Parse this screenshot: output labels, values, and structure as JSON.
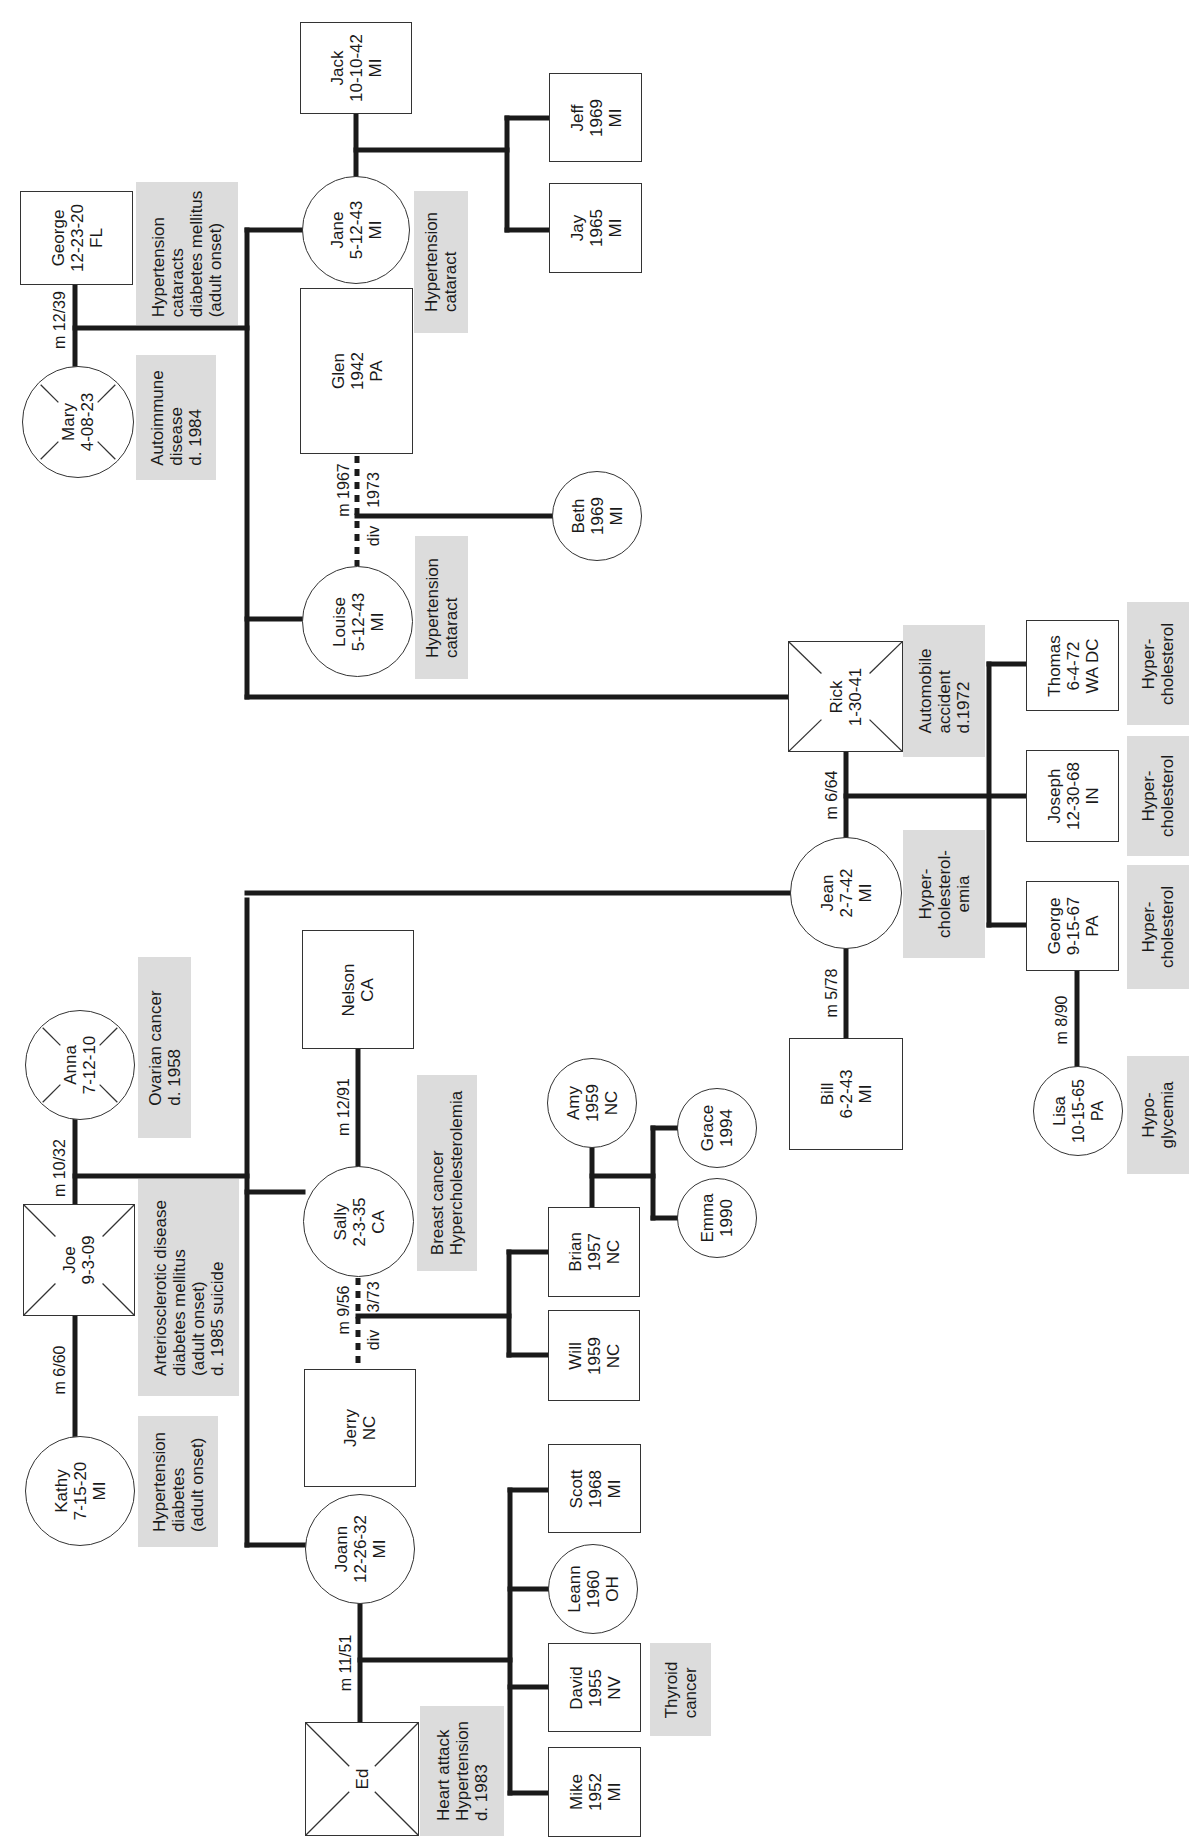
{
  "orientation": "rotated -90deg (text reads bottom-to-top)",
  "people": {
    "george_sr": {
      "name": "George",
      "born": "12-23-20",
      "place": "FL",
      "sex": "male",
      "deceased": false
    },
    "mary": {
      "name": "Mary",
      "born": "4-08-23",
      "sex": "female",
      "deceased": true
    },
    "jane": {
      "name": "Jane",
      "born": "5-12-43",
      "place": "MI",
      "sex": "female"
    },
    "jack": {
      "name": "Jack",
      "born": "10-10-42",
      "place": "MI",
      "sex": "male"
    },
    "jeff": {
      "name": "Jeff",
      "born": "1969",
      "place": "MI",
      "sex": "male"
    },
    "jay": {
      "name": "Jay",
      "born": "1965",
      "place": "MI",
      "sex": "male"
    },
    "glen": {
      "name": "Glen",
      "born": "1942",
      "place": "PA",
      "sex": "male"
    },
    "louise": {
      "name": "Louise",
      "born": "5-12-43",
      "place": "MI",
      "sex": "female"
    },
    "beth": {
      "name": "Beth",
      "born": "1969",
      "place": "MI",
      "sex": "female"
    },
    "rick": {
      "name": "Rick",
      "born": "1-30-41",
      "sex": "male",
      "deceased": true
    },
    "jean": {
      "name": "Jean",
      "born": "2-7-42",
      "place": "MI",
      "sex": "female"
    },
    "bill": {
      "name": "Bill",
      "born": "6-2-43",
      "place": "MI",
      "sex": "male"
    },
    "thomas": {
      "name": "Thomas",
      "born": "6-4-72",
      "place": "WA DC",
      "sex": "male"
    },
    "joseph": {
      "name": "Joseph",
      "born": "12-30-68",
      "place": "IN",
      "sex": "male"
    },
    "george_jr": {
      "name": "George",
      "born": "9-15-67",
      "place": "PA",
      "sex": "male"
    },
    "lisa": {
      "name": "Lisa",
      "born": "10-15-65",
      "place": "PA",
      "sex": "female"
    },
    "anna": {
      "name": "Anna",
      "born": "7-12-10",
      "sex": "female",
      "deceased": true
    },
    "joe": {
      "name": "Joe",
      "born": "9-3-09",
      "sex": "male",
      "deceased": true
    },
    "kathy": {
      "name": "Kathy",
      "born": "7-15-20",
      "place": "MI",
      "sex": "female"
    },
    "nelson": {
      "name": "Nelson",
      "place": "CA",
      "sex": "male"
    },
    "sally": {
      "name": "Sally",
      "born": "2-3-35",
      "place": "CA",
      "sex": "female"
    },
    "jerry": {
      "name": "Jerry",
      "place": "NC",
      "sex": "male"
    },
    "brian": {
      "name": "Brian",
      "born": "1957",
      "place": "NC",
      "sex": "male"
    },
    "will": {
      "name": "Will",
      "born": "1959",
      "place": "NC",
      "sex": "male"
    },
    "amy": {
      "name": "Amy",
      "born": "1959",
      "place": "NC",
      "sex": "female"
    },
    "grace": {
      "name": "Grace",
      "born": "1994",
      "sex": "female"
    },
    "emma": {
      "name": "Emma",
      "born": "1990",
      "sex": "female"
    },
    "joann": {
      "name": "Joann",
      "born": "12-26-32",
      "place": "MI",
      "sex": "female"
    },
    "ed": {
      "name": "Ed",
      "sex": "male",
      "deceased": true
    },
    "scott": {
      "name": "Scott",
      "born": "1968",
      "place": "MI",
      "sex": "male"
    },
    "leann": {
      "name": "Leann",
      "born": "1960",
      "place": "OH",
      "sex": "female"
    },
    "david": {
      "name": "David",
      "born": "1955",
      "place": "NV",
      "sex": "male"
    },
    "mike": {
      "name": "Mike",
      "born": "1952",
      "place": "MI",
      "sex": "male"
    }
  },
  "notes": {
    "george_sr": [
      "Hypertension",
      "cataracts",
      "diabetes mellitus",
      "(adult onset)"
    ],
    "mary": [
      "Autoimmune",
      "disease",
      "d. 1984"
    ],
    "jane": [
      "Hypertension",
      "cataract"
    ],
    "louise": [
      "Hypertension",
      "cataract"
    ],
    "rick": [
      "Automobile",
      "accident",
      "d.1972"
    ],
    "jean": [
      "Hyper-",
      "cholesterol-",
      "emia"
    ],
    "thomas": [
      "Hyper-",
      "cholesterol"
    ],
    "joseph": [
      "Hyper-",
      "cholesterol"
    ],
    "george_jr": [
      "Hyper-",
      "cholesterol"
    ],
    "lisa": [
      "Hypo-",
      "glycemia"
    ],
    "anna": [
      "Ovarian cancer",
      "d. 1958"
    ],
    "joe": [
      "Arteriosclerotic disease",
      "diabetes mellitus",
      "(adult onset)",
      "d. 1985 suicide"
    ],
    "kathy": [
      "Hypertension",
      "diabetes",
      "(adult onset)"
    ],
    "sally": [
      "Breast cancer",
      "Hypercholesterolemia"
    ],
    "ed": [
      "Heart attack",
      "Hypertension",
      "d. 1983"
    ],
    "david": [
      "Thyroid",
      "cancer"
    ]
  },
  "relationships": {
    "mary_george": "m 12/39",
    "louise_glen": {
      "married": "m 1967",
      "divorced": "div",
      "div_year": "1973"
    },
    "jean_rick": "m 6/64",
    "jean_bill": "m 5/78",
    "george_lisa": "m 8/90",
    "joe_anna": "m 10/32",
    "joe_kathy": "m 6/60",
    "sally_nelson": "m 12/91",
    "sally_jerry": {
      "married": "m 9/56",
      "divorced": "div",
      "div_year": "3/73"
    },
    "joann_ed": "m 11/51"
  },
  "colors": {
    "line": "#1a1a1a",
    "note_bg": "#dcdcdc",
    "node_border": "#333333"
  }
}
